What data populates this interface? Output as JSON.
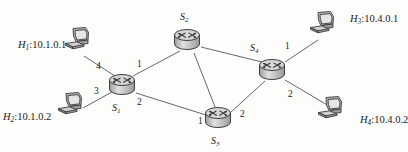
{
  "diagram": {
    "type": "network-topology",
    "title": "",
    "background_color": "#fdfdfc",
    "line_color": "#555555",
    "routers": [
      {
        "id": "S1",
        "label": "S",
        "sub": "1",
        "x": 122,
        "y": 85,
        "label_x": 112,
        "label_y": 103
      },
      {
        "id": "S2",
        "label": "S",
        "sub": "2",
        "x": 187,
        "y": 40,
        "label_x": 180,
        "label_y": 12
      },
      {
        "id": "S3",
        "label": "S",
        "sub": "3",
        "x": 218,
        "y": 118,
        "label_x": 211,
        "label_y": 136
      },
      {
        "id": "S4",
        "label": "S",
        "sub": "4",
        "x": 272,
        "y": 70,
        "label_x": 250,
        "label_y": 43
      }
    ],
    "hosts": [
      {
        "id": "H1",
        "name": "H",
        "sub": "1",
        "ip": "10.1.0.1",
        "x": 77,
        "y": 38,
        "label_x": 18,
        "label_y": 40,
        "label_align": "right"
      },
      {
        "id": "H2",
        "name": "H",
        "sub": "2",
        "ip": "10.1.0.2",
        "x": 70,
        "y": 103,
        "label_x": 3,
        "label_y": 112,
        "label_align": "right"
      },
      {
        "id": "H3",
        "name": "H",
        "sub": "3",
        "ip": "10.4.0.1",
        "x": 322,
        "y": 22,
        "label_x": 350,
        "label_y": 14,
        "label_align": "left"
      },
      {
        "id": "H4",
        "name": "H",
        "sub": "4",
        "ip": "10.4.0.2",
        "x": 330,
        "y": 107,
        "label_x": 360,
        "label_y": 115,
        "label_align": "left"
      }
    ],
    "links": [
      {
        "from": "H1",
        "to": "S1",
        "x1": 84,
        "y1": 56,
        "x2": 115,
        "y2": 76
      },
      {
        "from": "H2",
        "to": "S1",
        "x1": 83,
        "y1": 108,
        "x2": 112,
        "y2": 92
      },
      {
        "from": "S1",
        "to": "S2",
        "x1": 133,
        "y1": 76,
        "x2": 180,
        "y2": 51
      },
      {
        "from": "S1",
        "to": "S3",
        "x1": 136,
        "y1": 93,
        "x2": 206,
        "y2": 115
      },
      {
        "from": "S2",
        "to": "S3",
        "x1": 194,
        "y1": 53,
        "x2": 215,
        "y2": 107
      },
      {
        "from": "S2",
        "to": "S4",
        "x1": 201,
        "y1": 47,
        "x2": 262,
        "y2": 62
      },
      {
        "from": "S3",
        "to": "S4",
        "x1": 231,
        "y1": 112,
        "x2": 265,
        "y2": 81
      },
      {
        "from": "S4",
        "to": "H3",
        "x1": 285,
        "y1": 62,
        "x2": 318,
        "y2": 40
      },
      {
        "from": "S4",
        "to": "H4",
        "x1": 285,
        "y1": 80,
        "x2": 329,
        "y2": 106
      }
    ],
    "ports": [
      {
        "node": "S1",
        "number": "4",
        "x": 96,
        "y": 62
      },
      {
        "node": "S1",
        "number": "1",
        "x": 137,
        "y": 60
      },
      {
        "node": "S1",
        "number": "3",
        "x": 94,
        "y": 87
      },
      {
        "node": "S1",
        "number": "2",
        "x": 137,
        "y": 98
      },
      {
        "node": "S3",
        "number": "1",
        "x": 198,
        "y": 117
      },
      {
        "node": "S3",
        "number": "2",
        "x": 240,
        "y": 110
      },
      {
        "node": "S4",
        "number": "1",
        "x": 285,
        "y": 42
      },
      {
        "node": "S4",
        "number": "2",
        "x": 288,
        "y": 90
      }
    ]
  }
}
